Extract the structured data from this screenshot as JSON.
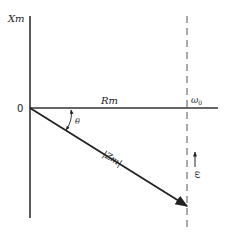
{
  "diagram": {
    "type": "impedance-phasor-diagram",
    "labels": {
      "y_axis": "Xm",
      "x_axis": "Rm",
      "origin": "0",
      "angle": "θ",
      "vector": "|Zm|",
      "omega_zero": "ω",
      "omega_zero_sub": "0",
      "omega": "ω"
    },
    "colors": {
      "ink": "#222222",
      "background": "#ffffff"
    }
  }
}
